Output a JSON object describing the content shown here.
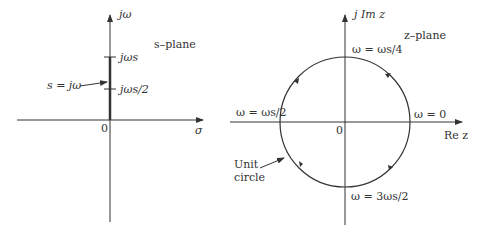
{
  "s_plane": {
    "title": "s–plane",
    "vertical_axis_label": "jω",
    "horizontal_axis_label": "σ",
    "origin_label": "0",
    "tick_upper_label": "jωs",
    "tick_lower_label": "jωs/2",
    "annotation": "s = jω"
  },
  "z_plane": {
    "title": "z–plane",
    "vertical_axis_label": "j Im z",
    "horizontal_axis_label": "Re z",
    "origin_label": "0",
    "top_point_label": "ω = ωs/4",
    "left_point_label": "ω = ωs/2",
    "right_point_label": "ω = 0",
    "bottom_point_label": "ω = 3ωs/2",
    "circle_label_line1": "Unit",
    "circle_label_line2": "circle"
  },
  "colors": {
    "ink": "#333333"
  }
}
